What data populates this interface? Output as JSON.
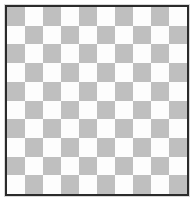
{
  "board": {
    "title": "International Draughts Board",
    "size": 10,
    "rows": 10,
    "columns": 10,
    "colors": {
      "light_square": "#fdfdfd",
      "dark_square": "#bfbfbf",
      "black_piece": "#161616",
      "white_piece": "#ffffff",
      "border": "#2b2b2b",
      "background": "#ffffff"
    },
    "dark_square_parity": "row+col even",
    "piece_counts": {
      "black": 16,
      "white": 16
    },
    "legend": {
      "black_piece_label": "black-man",
      "white_piece_label": "white-man",
      "empty_label": "empty-square"
    },
    "cells": [
      [
        "",
        "black",
        "",
        "black",
        "",
        "black",
        "",
        "black",
        "",
        "black"
      ],
      [
        "black",
        "",
        "",
        "",
        "black",
        "",
        "",
        "",
        "",
        ""
      ],
      [
        "",
        "black",
        "",
        "black",
        "",
        "black",
        "",
        "black",
        "",
        "black"
      ],
      [
        "",
        "",
        "black",
        "",
        "",
        "",
        "",
        "",
        "black",
        ""
      ],
      [
        "",
        "",
        "",
        "",
        "",
        "",
        "",
        "",
        "",
        "black"
      ],
      [
        "black",
        "",
        "",
        "",
        "white",
        "",
        "",
        "",
        "",
        ""
      ],
      [
        "",
        "",
        "",
        "white",
        "",
        "",
        "",
        "white",
        "",
        "white"
      ],
      [
        "white",
        "",
        "white",
        "",
        "white",
        "",
        "white",
        "",
        "white",
        ""
      ],
      [
        "",
        "white",
        "",
        "",
        "",
        "white",
        "",
        "white",
        "",
        "white"
      ],
      [
        "white",
        "",
        "white",
        "",
        "",
        "",
        "white",
        "",
        "",
        ""
      ]
    ]
  }
}
